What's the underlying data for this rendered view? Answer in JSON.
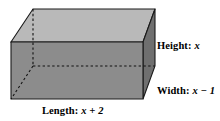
{
  "figure": {
    "type": "rectangular-prism",
    "colors": {
      "top_face": "#b9b9b9",
      "front_face": "#8c8c8c",
      "right_face": "#6f6f6f",
      "outline": "#1a1a1a",
      "hidden_edge": "#111111",
      "background": "#ffffff",
      "text": "#000000"
    },
    "vertices": {
      "top_front_left": [
        11,
        42
      ],
      "top_back_left": [
        33,
        9
      ],
      "top_back_right": [
        155,
        9
      ],
      "top_front_right": [
        143,
        42
      ],
      "bottom_front_left": [
        11,
        99
      ],
      "bottom_front_right": [
        143,
        99
      ],
      "bottom_back_right": [
        155,
        66
      ],
      "bottom_back_left_hidden": [
        33,
        66
      ]
    },
    "hidden_edges": [
      {
        "name": "vertical-back-left",
        "from": [
          33,
          9
        ],
        "to": [
          33,
          66
        ]
      },
      {
        "name": "back-bottom",
        "from": [
          33,
          66
        ],
        "to": [
          155,
          66
        ]
      },
      {
        "name": "bottom-left-depth",
        "from": [
          33,
          66
        ],
        "to": [
          11,
          99
        ]
      }
    ]
  },
  "labels": {
    "height": {
      "name": "Height:",
      "value": "x"
    },
    "width": {
      "name": "Width:",
      "value": "x − 1"
    },
    "length": {
      "name": "Length:",
      "value": "x + 2"
    }
  }
}
